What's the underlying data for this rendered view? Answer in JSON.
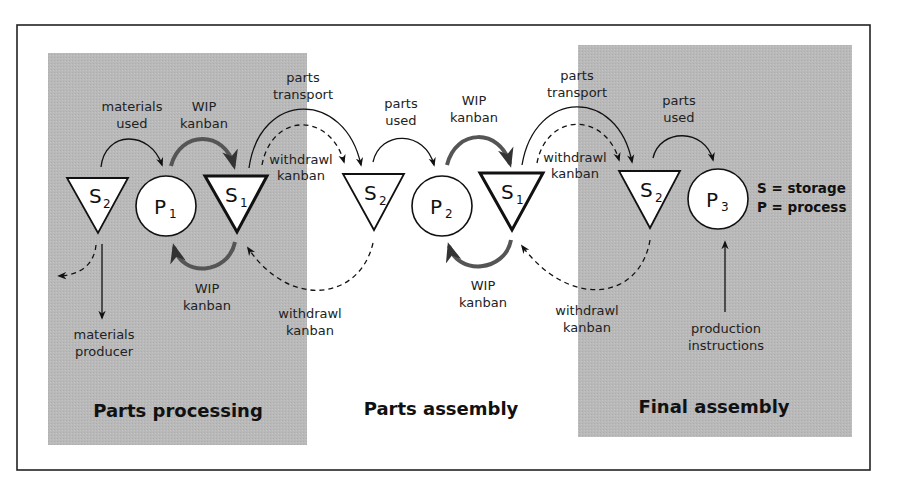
{
  "diagram": {
    "type": "kanban-flow",
    "colors": {
      "panel_gray": "#b8b8b8",
      "frame": "#222222",
      "wip_arrow": "#555555",
      "node_fill": "#ffffff"
    },
    "sections": [
      {
        "id": "parts-processing",
        "title": "Parts processing",
        "shaded": true
      },
      {
        "id": "parts-assembly",
        "title": "Parts assembly",
        "shaded": false
      },
      {
        "id": "final-assembly",
        "title": "Final assembly",
        "shaded": true
      }
    ],
    "nodes": {
      "pp_s2": {
        "letter": "S",
        "sub": "2",
        "kind": "storage"
      },
      "pp_p1": {
        "letter": "P",
        "sub": "1",
        "kind": "process"
      },
      "pp_s1": {
        "letter": "S",
        "sub": "1",
        "kind": "storage"
      },
      "pa_s2": {
        "letter": "S",
        "sub": "2",
        "kind": "storage"
      },
      "pa_p2": {
        "letter": "P",
        "sub": "2",
        "kind": "process"
      },
      "pa_s1": {
        "letter": "S",
        "sub": "1",
        "kind": "storage"
      },
      "fa_s2": {
        "letter": "S",
        "sub": "2",
        "kind": "storage"
      },
      "fa_p3": {
        "letter": "P",
        "sub": "3",
        "kind": "process"
      }
    },
    "labels": {
      "materials_used": [
        "materials",
        "used"
      ],
      "wip_kanban_top_1": [
        "WIP",
        "kanban"
      ],
      "parts_transport_1": [
        "parts",
        "transport"
      ],
      "withdrawl_kanban_top_1": [
        "withdrawl",
        "kanban"
      ],
      "parts_used_1": [
        "parts",
        "used"
      ],
      "wip_kanban_top_2": [
        "WIP",
        "kanban"
      ],
      "parts_transport_2": [
        "parts",
        "transport"
      ],
      "withdrawl_kanban_top_2": [
        "withdrawl",
        "kanban"
      ],
      "parts_used_2": [
        "parts",
        "used"
      ],
      "wip_kanban_bottom_1": [
        "WIP",
        "kanban"
      ],
      "withdrawl_kanban_bottom_1": [
        "withdrawl",
        "kanban"
      ],
      "wip_kanban_bottom_2": [
        "WIP",
        "kanban"
      ],
      "withdrawl_kanban_bottom_2": [
        "withdrawl",
        "kanban"
      ],
      "materials_producer": [
        "materials",
        "producer"
      ],
      "production_instructions": [
        "production",
        "instructions"
      ]
    },
    "legend": {
      "storage": "S = storage",
      "process": "P = process"
    }
  }
}
